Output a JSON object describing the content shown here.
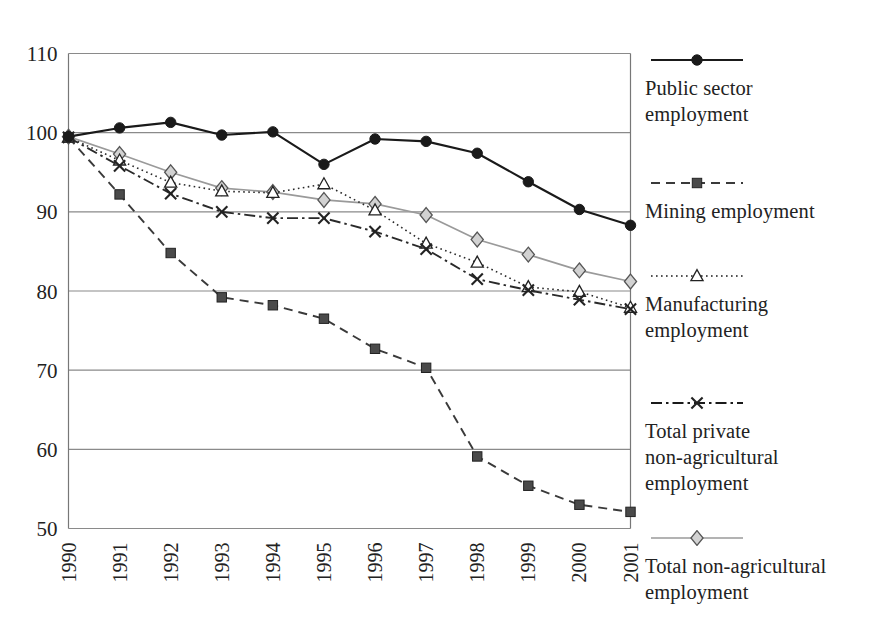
{
  "chart_data": {
    "type": "line",
    "title": "",
    "subtitle": "",
    "xlabel": "",
    "ylabel": "",
    "categories": [
      "1990",
      "1991",
      "1992",
      "1993",
      "1994",
      "1995",
      "1996",
      "1997",
      "1998",
      "1999",
      "2000",
      "2001"
    ],
    "x": [
      1990,
      1991,
      1992,
      1993,
      1994,
      1995,
      1996,
      1997,
      1998,
      1999,
      2000,
      2001
    ],
    "xlim": [
      1990,
      2001
    ],
    "ylim": [
      50,
      110
    ],
    "yticks": [
      50,
      60,
      70,
      80,
      90,
      100,
      110
    ],
    "ytick_labels": [
      "50",
      "60",
      "70",
      "80",
      "90",
      "100",
      "110"
    ],
    "grid": "horizontal",
    "legend_position": "right",
    "series": [
      {
        "name": "Public sector employment",
        "marker": "filled-circle",
        "line_style": "solid",
        "color": "#1a1a1a",
        "values": [
          99.5,
          100.6,
          101.3,
          99.7,
          100.1,
          96.0,
          99.2,
          98.9,
          97.4,
          93.8,
          90.3,
          88.3
        ]
      },
      {
        "name": "Mining employment",
        "marker": "filled-square",
        "line_style": "dashed",
        "color": "#3a3a3a",
        "values": [
          99.4,
          92.2,
          84.8,
          79.2,
          78.2,
          76.5,
          72.7,
          70.3,
          59.1,
          55.4,
          53.0,
          52.1
        ]
      },
      {
        "name": "Manufacturing employment",
        "marker": "open-triangle",
        "line_style": "dotted",
        "color": "#2a2a2a",
        "values": [
          99.4,
          96.5,
          93.7,
          92.6,
          92.4,
          93.5,
          90.2,
          86.0,
          83.6,
          80.5,
          79.9,
          77.9
        ]
      },
      {
        "name": "Total private non-agricultural employment",
        "marker": "cross-x",
        "line_style": "dash-dot",
        "color": "#2a2a2a",
        "values": [
          99.4,
          95.8,
          92.3,
          90.0,
          89.2,
          89.2,
          87.5,
          85.3,
          81.5,
          80.1,
          78.9,
          77.7
        ]
      },
      {
        "name": "Total non-agricultural employment",
        "marker": "open-diamond",
        "line_style": "solid-light",
        "color": "#9a9a9a",
        "values": [
          99.5,
          97.3,
          95.0,
          93.0,
          92.5,
          91.5,
          91.0,
          89.6,
          86.5,
          84.6,
          82.6,
          81.2
        ]
      }
    ]
  },
  "legend": {
    "entries": [
      {
        "label_line1": "Public sector",
        "label_line2": "employment",
        "marker": "filled-circle",
        "line_style": "solid"
      },
      {
        "label_line1": "Mining employment",
        "label_line2": "",
        "marker": "filled-square",
        "line_style": "dashed"
      },
      {
        "label_line1": "Manufacturing",
        "label_line2": "employment",
        "marker": "open-triangle",
        "line_style": "dotted"
      },
      {
        "label_line1": "Total private",
        "label_line2": "non-agricultural",
        "label_line3": "employment",
        "marker": "cross-x",
        "line_style": "dash-dot"
      },
      {
        "label_line1": "Total non-agricultural",
        "label_line2": "employment",
        "marker": "open-diamond",
        "line_style": "solid-light"
      }
    ]
  },
  "axes": {
    "y_labels": [
      "110",
      "100",
      "90",
      "80",
      "70",
      "60",
      "50"
    ],
    "x_labels": [
      "1990",
      "1991",
      "1992",
      "1993",
      "1994",
      "1995",
      "1996",
      "1997",
      "1998",
      "1999",
      "2000",
      "2001"
    ]
  },
  "colors": {
    "axis": "#777777",
    "grid": "#8a8a8a",
    "dark_series": "#1a1a1a",
    "light_series": "#9a9a9a",
    "text": "#222222",
    "background": "#ffffff"
  }
}
